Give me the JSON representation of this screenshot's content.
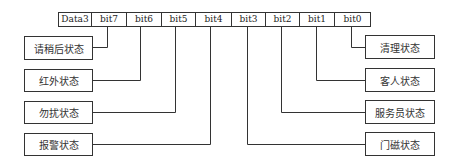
{
  "register": {
    "cells": [
      "Data3",
      "bit7",
      "bit6",
      "bit5",
      "bit4",
      "bit3",
      "bit2",
      "bit1",
      "bit0"
    ]
  },
  "left_labels": [
    {
      "bit": "bit7",
      "label": "请稍后状态"
    },
    {
      "bit": "bit6",
      "label": "红外状态"
    },
    {
      "bit": "bit5",
      "label": "勿扰状态"
    },
    {
      "bit": "bit4",
      "label": "报警状态"
    }
  ],
  "right_labels": [
    {
      "bit": "bit0",
      "label": "清理状态"
    },
    {
      "bit": "bit1",
      "label": "客人状态"
    },
    {
      "bit": "bit2",
      "label": "服务员状态"
    },
    {
      "bit": "bit3",
      "label": "门磁状态"
    }
  ],
  "colors": {
    "line": "#333333",
    "background": "#ffffff"
  }
}
